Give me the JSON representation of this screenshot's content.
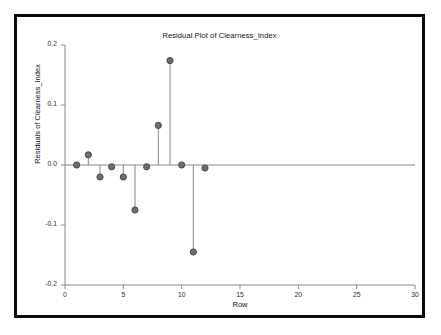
{
  "figure": {
    "title": "Residual Plot of Clearness_Index",
    "xlabel": "Row",
    "ylabel": "Residuals of Clearness_Index",
    "frame_color": "#0a0a0a",
    "background": "#ffffff",
    "marker_color": "#6e6e6e",
    "marker_edge_color": "#4a4a4a",
    "stem_color": "#8a8a8a",
    "axis_color": "#8a8a8a",
    "text_color": "#111111"
  },
  "chart_data": {
    "type": "scatter",
    "subtype": "stem-residual-plot",
    "title": "Residual Plot of Clearness_Index",
    "xlabel": "Row",
    "ylabel": "Residuals of Clearness_Index",
    "xlim": [
      0,
      30
    ],
    "ylim": [
      -0.2,
      0.2
    ],
    "xticks": [
      0,
      5,
      10,
      15,
      20,
      25,
      30
    ],
    "xtick_labels": [
      "0",
      "5",
      "10",
      "15",
      "20",
      "25",
      "30"
    ],
    "yticks": [
      0.2,
      0.1,
      0.0,
      -0.1,
      -0.2
    ],
    "ytick_labels": [
      "0.2",
      "0.1",
      "0.0",
      "-0.1",
      "-0.2"
    ],
    "grid": false,
    "legend": null,
    "reference_line_y": 0.0,
    "x": [
      1,
      2,
      3,
      4,
      5,
      6,
      7,
      8,
      9,
      10,
      11,
      12
    ],
    "values": [
      0.0,
      0.017,
      -0.02,
      -0.003,
      -0.02,
      -0.075,
      -0.003,
      0.066,
      0.174,
      0.0,
      -0.145,
      -0.005
    ],
    "series": [
      {
        "name": "Residuals of Clearness_Index",
        "points": [
          {
            "row": 1,
            "residual": 0.0
          },
          {
            "row": 2,
            "residual": 0.017
          },
          {
            "row": 3,
            "residual": -0.02
          },
          {
            "row": 4,
            "residual": -0.003
          },
          {
            "row": 5,
            "residual": -0.02
          },
          {
            "row": 6,
            "residual": -0.075
          },
          {
            "row": 7,
            "residual": -0.003
          },
          {
            "row": 8,
            "residual": 0.066
          },
          {
            "row": 9,
            "residual": 0.174
          },
          {
            "row": 10,
            "residual": 0.0
          },
          {
            "row": 11,
            "residual": -0.145
          },
          {
            "row": 12,
            "residual": -0.005
          }
        ]
      }
    ]
  }
}
